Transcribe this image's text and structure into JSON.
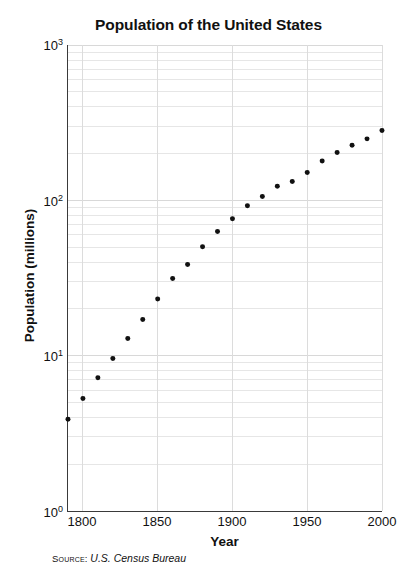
{
  "chart_data": {
    "type": "scatter",
    "title": "Population of the United States",
    "xlabel": "Year",
    "ylabel": "Population (millions)",
    "source_label": "Source:",
    "source_value": "U.S. Census Bureau",
    "xlim": [
      1790,
      2000
    ],
    "ylim": [
      1,
      1000
    ],
    "yscale": "log",
    "xscale": "linear",
    "grid": true,
    "grid_minor": true,
    "legend": "none",
    "marker_color": "#111111",
    "grid_color": "#e6e6e6",
    "axis_color": "#3a3a3a",
    "xticks": [
      1800,
      1850,
      1900,
      1950,
      2000
    ],
    "xtick_labels": [
      "1800",
      "1850",
      "1900",
      "1950",
      "2000"
    ],
    "yticks": [
      1,
      10,
      100,
      1000
    ],
    "ytick_labels": [
      "10",
      "10",
      "10",
      "10"
    ],
    "ytick_exponents": [
      "0",
      "1",
      "2",
      "3"
    ],
    "x": [
      1790,
      1800,
      1810,
      1820,
      1830,
      1840,
      1850,
      1860,
      1870,
      1880,
      1890,
      1900,
      1910,
      1920,
      1930,
      1940,
      1950,
      1960,
      1970,
      1980,
      1990,
      2000
    ],
    "values": [
      3.9,
      5.3,
      7.2,
      9.6,
      12.9,
      17.1,
      23.2,
      31.4,
      38.6,
      50.2,
      62.9,
      76.2,
      92.2,
      106.0,
      123.2,
      132.2,
      151.3,
      179.3,
      203.3,
      226.5,
      248.7,
      281.4
    ],
    "series": [
      {
        "name": "U.S. population",
        "values": [
          3.9,
          5.3,
          7.2,
          9.6,
          12.9,
          17.1,
          23.2,
          31.4,
          38.6,
          50.2,
          62.9,
          76.2,
          92.2,
          106.0,
          123.2,
          132.2,
          151.3,
          179.3,
          203.3,
          226.5,
          248.7,
          281.4
        ]
      }
    ]
  }
}
